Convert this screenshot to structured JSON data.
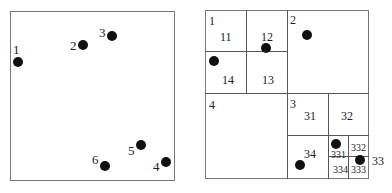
{
  "left_panel": {
    "points": [
      {
        "label": "1",
        "x": 18,
        "y": 62
      },
      {
        "label": "2",
        "x": 83,
        "y": 45
      },
      {
        "label": "3",
        "x": 112,
        "y": 36
      },
      {
        "label": "4",
        "x": 166,
        "y": 162
      },
      {
        "label": "5",
        "x": 141,
        "y": 145
      },
      {
        "label": "6",
        "x": 105,
        "y": 166
      }
    ]
  },
  "right_panel": {
    "regions": [
      {
        "label": "1"
      },
      {
        "label": "11"
      },
      {
        "label": "12"
      },
      {
        "label": "13"
      },
      {
        "label": "14"
      },
      {
        "label": "2"
      },
      {
        "label": "3"
      },
      {
        "label": "31"
      },
      {
        "label": "32"
      },
      {
        "label": "33"
      },
      {
        "label": "34"
      },
      {
        "label": "331"
      },
      {
        "label": "332"
      },
      {
        "label": "333"
      },
      {
        "label": "334"
      },
      {
        "label": "4"
      }
    ],
    "points": [
      {
        "region": "12",
        "x": 266,
        "y": 48
      },
      {
        "region": "14",
        "x": 214,
        "y": 61
      },
      {
        "region": "2",
        "x": 307,
        "y": 35
      },
      {
        "region": "34",
        "x": 300,
        "y": 165
      },
      {
        "region": "331",
        "x": 336,
        "y": 144
      },
      {
        "region": "333",
        "x": 360,
        "y": 160
      }
    ]
  }
}
